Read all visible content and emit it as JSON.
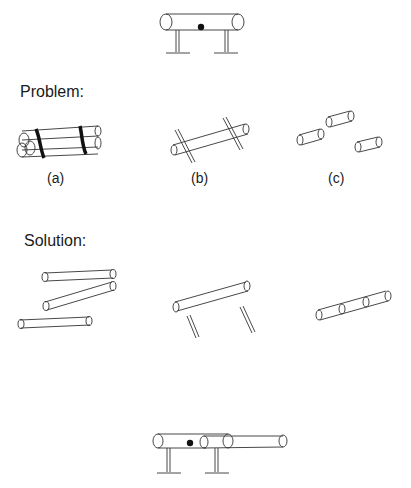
{
  "sections": {
    "problem": {
      "label": "Problem:"
    },
    "solution": {
      "label": "Solution:"
    }
  },
  "problem_cases": [
    {
      "label": "(a)",
      "description": "bundle-of-cylinders-bound"
    },
    {
      "label": "(b)",
      "description": "cylinder-crossed-by-rods"
    },
    {
      "label": "(c)",
      "description": "three-short-cylinders"
    }
  ],
  "figures": {
    "top": "pipe-on-two-supports-with-dot",
    "bottom": "extended-pipe-on-two-supports-with-dot"
  },
  "colors": {
    "ink": "#1a1a1a",
    "background": "#ffffff"
  }
}
